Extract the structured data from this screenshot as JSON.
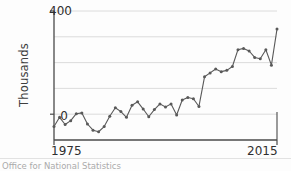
{
  "axis": {
    "ylabel": "Thousands",
    "ytick_top": "400",
    "ytick_zero": "0",
    "xtick_left": "1975",
    "xtick_right": "2015"
  },
  "source": {
    "text": "Office for National Statistics"
  },
  "style": {
    "line_color": "#595959",
    "marker_color": "#595959",
    "grid_color": "#d8d8d8",
    "axis_color": "#4a4a4a",
    "background": "#fdfdfd"
  },
  "chart_data": {
    "type": "line",
    "title": "",
    "subtitle": "",
    "xlabel": "",
    "ylabel": "Thousands",
    "xlim": [
      1975,
      2015
    ],
    "ylim": [
      -100,
      400
    ],
    "yticks": [
      0,
      400
    ],
    "gridlines": [
      0,
      100,
      200,
      300,
      400
    ],
    "grid": true,
    "legend": false,
    "markers": true,
    "x": [
      1975,
      1976,
      1977,
      1978,
      1979,
      1980,
      1981,
      1982,
      1983,
      1984,
      1985,
      1986,
      1987,
      1988,
      1989,
      1990,
      1991,
      1992,
      1993,
      1994,
      1995,
      1996,
      1997,
      1998,
      1999,
      2000,
      2001,
      2002,
      2003,
      2004,
      2005,
      2006,
      2007,
      2008,
      2009,
      2010,
      2011,
      2012,
      2013,
      2014,
      2015
    ],
    "series": [
      {
        "name": "Net migration",
        "values": [
          -48,
          -12,
          -40,
          -25,
          2,
          5,
          -38,
          -62,
          -68,
          -48,
          -8,
          25,
          10,
          -12,
          35,
          48,
          20,
          -10,
          18,
          40,
          28,
          40,
          -3,
          55,
          65,
          60,
          30,
          145,
          160,
          175,
          165,
          170,
          185,
          250,
          255,
          245,
          220,
          215,
          250,
          190,
          330
        ]
      }
    ]
  }
}
